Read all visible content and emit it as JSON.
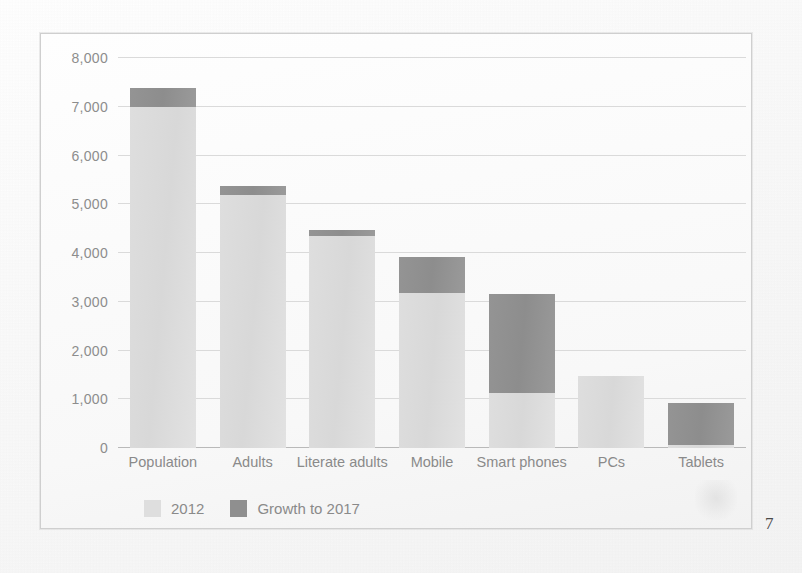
{
  "page": {
    "page_number": "7",
    "frame_color": "#cfcfcf",
    "background_color": "#fdfdfd"
  },
  "chart_data": {
    "type": "bar",
    "subtype": "stacked-bar",
    "title": "",
    "subtitle": "",
    "xlabel": "",
    "ylabel": "",
    "categories": [
      "Population",
      "Adults",
      "Literate adults",
      "Mobile",
      "Smart phones",
      "PCs",
      "Tablets"
    ],
    "series": [
      {
        "name": "2012",
        "color": "#dedede",
        "values": [
          7000,
          5180,
          4350,
          3170,
          1130,
          1480,
          60
        ]
      },
      {
        "name": "Growth to 2017",
        "color": "#8f8f8f",
        "values": [
          380,
          200,
          130,
          740,
          2020,
          0,
          860
        ]
      }
    ],
    "totals": [
      7380,
      5380,
      4480,
      3910,
      3150,
      1480,
      920
    ],
    "ylim": [
      0,
      8000
    ],
    "yticks": [
      0,
      1000,
      2000,
      3000,
      4000,
      5000,
      6000,
      7000,
      8000
    ],
    "ytick_labels": [
      "0",
      "1,000",
      "2,000",
      "3,000",
      "4,000",
      "5,000",
      "6,000",
      "7,000",
      "8,000"
    ],
    "grid": true,
    "grid_color": "#dadada",
    "legend_position": "bottom-left",
    "legend": [
      "2012",
      "Growth to 2017"
    ],
    "units": "millions"
  }
}
